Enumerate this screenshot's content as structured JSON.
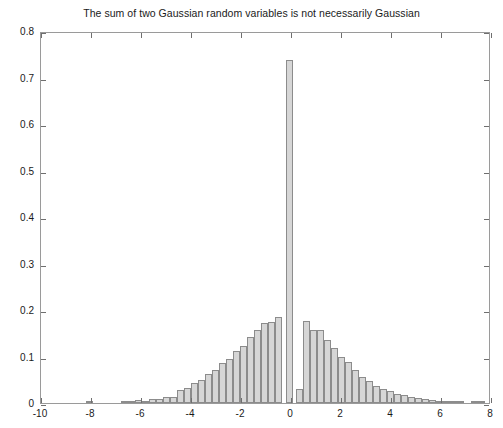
{
  "chart_data": {
    "type": "bar",
    "title": "The sum of two Gaussian random variables is not necessarily Gaussian",
    "xlabel": "",
    "ylabel": "",
    "xlim": [
      -10,
      8
    ],
    "ylim": [
      0,
      0.8
    ],
    "xticks": [
      -10,
      -8,
      -6,
      -4,
      -2,
      0,
      2,
      4,
      6,
      8
    ],
    "xticklabels": [
      "-10",
      "-8",
      "-6",
      "-4",
      "-2",
      "0",
      "2",
      "4",
      "6",
      "8"
    ],
    "yticks": [
      0,
      0.1,
      0.2,
      0.3,
      0.4,
      0.5,
      0.6,
      0.7,
      0.8
    ],
    "yticklabels": [
      "0",
      "0.1",
      "0.2",
      "0.3",
      "0.4",
      "0.5",
      "0.6",
      "0.7",
      "0.8"
    ],
    "grid": false,
    "legend": null,
    "bin_width": 0.28,
    "bar_fill": "#d6d6d6",
    "bar_edge": "#8c8c8c",
    "bins": [
      {
        "x": -8.05,
        "value": 0.004
      },
      {
        "x": -7.77,
        "value": 0.0
      },
      {
        "x": -7.49,
        "value": 0.0
      },
      {
        "x": -7.21,
        "value": 0.0
      },
      {
        "x": -6.93,
        "value": 0.0
      },
      {
        "x": -6.65,
        "value": 0.001
      },
      {
        "x": -6.37,
        "value": 0.002
      },
      {
        "x": -6.09,
        "value": 0.006
      },
      {
        "x": -5.81,
        "value": 0.005
      },
      {
        "x": -5.53,
        "value": 0.008
      },
      {
        "x": -5.25,
        "value": 0.009
      },
      {
        "x": -4.97,
        "value": 0.013
      },
      {
        "x": -4.69,
        "value": 0.014
      },
      {
        "x": -4.41,
        "value": 0.028
      },
      {
        "x": -4.13,
        "value": 0.032
      },
      {
        "x": -3.85,
        "value": 0.042
      },
      {
        "x": -3.57,
        "value": 0.049
      },
      {
        "x": -3.29,
        "value": 0.062
      },
      {
        "x": -3.01,
        "value": 0.07
      },
      {
        "x": -2.73,
        "value": 0.086
      },
      {
        "x": -2.45,
        "value": 0.095
      },
      {
        "x": -2.17,
        "value": 0.112
      },
      {
        "x": -1.89,
        "value": 0.122
      },
      {
        "x": -1.61,
        "value": 0.142
      },
      {
        "x": -1.33,
        "value": 0.158
      },
      {
        "x": -1.05,
        "value": 0.172
      },
      {
        "x": -0.77,
        "value": 0.175
      },
      {
        "x": -0.49,
        "value": 0.185
      },
      {
        "x": -0.21,
        "value": 0.0
      },
      {
        "x": -0.07,
        "value": 0.738
      },
      {
        "x": 0.21,
        "value": 0.0
      },
      {
        "x": 0.35,
        "value": 0.03
      },
      {
        "x": 0.63,
        "value": 0.176
      },
      {
        "x": 0.91,
        "value": 0.157
      },
      {
        "x": 1.19,
        "value": 0.158
      },
      {
        "x": 1.47,
        "value": 0.135
      },
      {
        "x": 1.75,
        "value": 0.118
      },
      {
        "x": 2.03,
        "value": 0.1
      },
      {
        "x": 2.31,
        "value": 0.088
      },
      {
        "x": 2.59,
        "value": 0.072
      },
      {
        "x": 2.87,
        "value": 0.057
      },
      {
        "x": 3.15,
        "value": 0.048
      },
      {
        "x": 3.43,
        "value": 0.036
      },
      {
        "x": 3.71,
        "value": 0.031
      },
      {
        "x": 3.99,
        "value": 0.026
      },
      {
        "x": 4.27,
        "value": 0.02
      },
      {
        "x": 4.55,
        "value": 0.018
      },
      {
        "x": 4.83,
        "value": 0.013
      },
      {
        "x": 5.11,
        "value": 0.011
      },
      {
        "x": 5.39,
        "value": 0.008
      },
      {
        "x": 5.67,
        "value": 0.006
      },
      {
        "x": 5.95,
        "value": 0.004
      },
      {
        "x": 6.23,
        "value": 0.003
      },
      {
        "x": 6.51,
        "value": 0.001
      },
      {
        "x": 6.79,
        "value": 0.001
      },
      {
        "x": 7.07,
        "value": 0.0
      },
      {
        "x": 7.35,
        "value": 0.002
      },
      {
        "x": 7.63,
        "value": 0.001
      }
    ]
  }
}
